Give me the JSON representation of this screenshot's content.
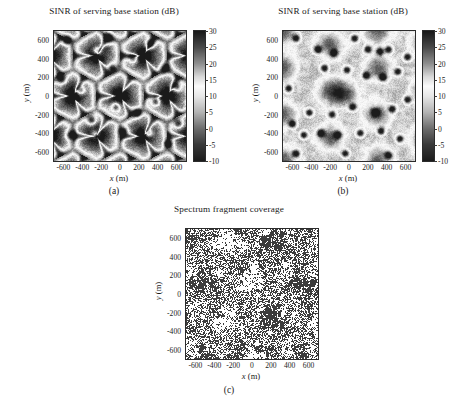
{
  "figure": {
    "width": 457,
    "height": 402,
    "background": "#ffffff",
    "font_color": "#1a1a1a"
  },
  "panels": [
    {
      "id": "panel-a",
      "caption": "(a)",
      "title": "SINR of serving base station (dB)",
      "xlabel_var": "x",
      "xlabel_unit": "(m)",
      "ylabel_var": "y",
      "ylabel_unit": "(m)"
    },
    {
      "id": "panel-b",
      "caption": "(b)",
      "title": "SINR of serving base station (dB)",
      "xlabel_var": "x",
      "xlabel_unit": "(m)",
      "ylabel_var": "y",
      "ylabel_unit": "(m)"
    },
    {
      "id": "panel-c",
      "caption": "(c)",
      "title": "Spectrum fragment coverage",
      "xlabel_var": "x",
      "xlabel_unit": "(m)",
      "ylabel_var": "y",
      "ylabel_unit": "(m)"
    }
  ],
  "chart_data": [
    {
      "id": "panel-a",
      "type": "heatmap",
      "title": "SINR of serving base station (dB)",
      "xlabel": "x (m)",
      "ylabel": "y (m)",
      "xlim": [
        -700,
        700
      ],
      "ylim": [
        -700,
        700
      ],
      "xticks": [
        -600,
        -400,
        -200,
        0,
        200,
        400,
        600
      ],
      "yticks": [
        -600,
        -400,
        -200,
        0,
        200,
        400,
        600
      ],
      "xticklabels": [
        "-600",
        "-400",
        "-200",
        "0",
        "200",
        "400",
        "600"
      ],
      "yticklabels": [
        "-600",
        "-400",
        "-200",
        "0",
        "200",
        "400",
        "600"
      ],
      "grid": false,
      "colorbar": {
        "label": "",
        "vmin": -10,
        "vmax": 30,
        "ticks": [
          -10,
          -5,
          0,
          5,
          10,
          15,
          20,
          25,
          30
        ],
        "ticklabels": [
          "-10",
          "-5",
          "0",
          "5",
          "10",
          "15",
          "20",
          "25",
          "30"
        ],
        "orientation": "vertical",
        "position": "right",
        "colormap": "gray-inverted-diverging",
        "colormap_stops": [
          {
            "value": -10,
            "color": "#1c1c1c"
          },
          {
            "value": -5,
            "color": "#3a3a3a"
          },
          {
            "value": 0,
            "color": "#6e6e6e"
          },
          {
            "value": 5,
            "color": "#b4b4b4"
          },
          {
            "value": 10,
            "color": "#e8e8e8"
          },
          {
            "value": 13,
            "color": "#fbfbfb"
          },
          {
            "value": 16,
            "color": "#d8d8d8"
          },
          {
            "value": 20,
            "color": "#8f8f8f"
          },
          {
            "value": 25,
            "color": "#4a4a4a"
          },
          {
            "value": 30,
            "color": "#1a1a1a"
          }
        ]
      },
      "scene": {
        "description": "Sectorized (3-sector) macro deployment: bright cell-centre plateaus with dark triangular cell-edge wedges converging at hexagonal site vertices, plus scattered dark small-cell spots.",
        "site_spacing_m": 500,
        "sector_count": 3,
        "site_positions": [
          [
            -700,
            -700
          ],
          [
            -700,
            -200
          ],
          [
            -700,
            300
          ],
          [
            -200,
            -450
          ],
          [
            -200,
            50
          ],
          [
            -200,
            550
          ],
          [
            300,
            -700
          ],
          [
            300,
            -200
          ],
          [
            300,
            300
          ],
          [
            -700,
            700
          ],
          [
            300,
            700
          ],
          [
            800,
            -450
          ],
          [
            800,
            50
          ],
          [
            800,
            550
          ]
        ],
        "hotspot_positions": [
          [
            -560,
            600
          ],
          [
            -240,
            480
          ],
          [
            -80,
            300
          ],
          [
            140,
            400
          ],
          [
            320,
            560
          ],
          [
            480,
            300
          ],
          [
            600,
            100
          ],
          [
            380,
            -60
          ],
          [
            180,
            -180
          ],
          [
            -40,
            -120
          ],
          [
            -300,
            -260
          ],
          [
            -520,
            -420
          ],
          [
            -260,
            -420
          ],
          [
            40,
            -380
          ],
          [
            300,
            -400
          ],
          [
            520,
            -520
          ],
          [
            620,
            -300
          ],
          [
            -620,
            180
          ],
          [
            -420,
            60
          ],
          [
            -120,
            620
          ]
        ],
        "noise_amplitude_db": 3.2,
        "value_range_db": [
          -10,
          30
        ]
      }
    },
    {
      "id": "panel-b",
      "type": "heatmap",
      "title": "SINR of serving base station (dB)",
      "xlabel": "x (m)",
      "ylabel": "y (m)",
      "xlim": [
        -700,
        700
      ],
      "ylim": [
        -700,
        700
      ],
      "xticks": [
        -600,
        -400,
        -200,
        0,
        200,
        400,
        600
      ],
      "yticks": [
        -600,
        -400,
        -200,
        0,
        200,
        400,
        600
      ],
      "xticklabels": [
        "-600",
        "-400",
        "-200",
        "0",
        "200",
        "400",
        "600"
      ],
      "yticklabels": [
        "-600",
        "-400",
        "-200",
        "0",
        "200",
        "400",
        "600"
      ],
      "grid": false,
      "colorbar": {
        "label": "",
        "vmin": -10,
        "vmax": 30,
        "ticks": [
          -10,
          -5,
          0,
          5,
          10,
          15,
          20,
          25,
          30
        ],
        "ticklabels": [
          "-10",
          "-5",
          "0",
          "5",
          "10",
          "15",
          "20",
          "25",
          "30"
        ],
        "orientation": "vertical",
        "position": "right",
        "colormap": "gray-inverted-diverging",
        "colormap_stops": [
          {
            "value": -10,
            "color": "#1c1c1c"
          },
          {
            "value": -5,
            "color": "#3a3a3a"
          },
          {
            "value": 0,
            "color": "#6e6e6e"
          },
          {
            "value": 5,
            "color": "#b4b4b4"
          },
          {
            "value": 10,
            "color": "#e8e8e8"
          },
          {
            "value": 13,
            "color": "#fbfbfb"
          },
          {
            "value": 16,
            "color": "#d8d8d8"
          },
          {
            "value": 20,
            "color": "#8f8f8f"
          },
          {
            "value": 25,
            "color": "#4a4a4a"
          },
          {
            "value": 30,
            "color": "#1a1a1a"
          }
        ]
      },
      "scene": {
        "description": "Omnidirectional deployment: mostly bright high-SINR background with diffuse dark blobs centred on macro sites and many small circular dark spots at small-cell locations.",
        "site_spacing_m": 500,
        "sector_count": 1,
        "blob_positions": [
          [
            -700,
            -700
          ],
          [
            -700,
            -200
          ],
          [
            -700,
            300
          ],
          [
            -700,
            700
          ],
          [
            -200,
            -450
          ],
          [
            -200,
            50
          ],
          [
            -200,
            550
          ],
          [
            300,
            -700
          ],
          [
            300,
            -200
          ],
          [
            300,
            300
          ],
          [
            300,
            700
          ],
          [
            800,
            -450
          ],
          [
            800,
            50
          ],
          [
            800,
            550
          ],
          [
            -40,
            20
          ]
        ],
        "hotspot_positions": [
          [
            -560,
            620
          ],
          [
            -330,
            500
          ],
          [
            -160,
            460
          ],
          [
            60,
            620
          ],
          [
            200,
            500
          ],
          [
            330,
            480
          ],
          [
            420,
            500
          ],
          [
            -260,
            300
          ],
          [
            -20,
            280
          ],
          [
            180,
            220
          ],
          [
            360,
            200
          ],
          [
            520,
            260
          ],
          [
            620,
            -40
          ],
          [
            460,
            -140
          ],
          [
            280,
            -180
          ],
          [
            40,
            -120
          ],
          [
            -180,
            -200
          ],
          [
            -420,
            -180
          ],
          [
            -600,
            -300
          ],
          [
            -480,
            -420
          ],
          [
            -300,
            -400
          ],
          [
            -120,
            -420
          ],
          [
            120,
            -400
          ],
          [
            340,
            -380
          ],
          [
            540,
            -460
          ],
          [
            -560,
            -620
          ],
          [
            -40,
            -620
          ],
          [
            420,
            -640
          ],
          [
            620,
            420
          ],
          [
            -640,
            80
          ]
        ],
        "noise_amplitude_db": 2.6,
        "value_range_db": [
          -10,
          30
        ]
      }
    },
    {
      "id": "panel-c",
      "type": "heatmap",
      "title": "Spectrum fragment coverage",
      "xlabel": "x (m)",
      "ylabel": "y (m)",
      "xlim": [
        -700,
        700
      ],
      "ylim": [
        -700,
        700
      ],
      "xticks": [
        -600,
        -400,
        -200,
        0,
        200,
        400,
        600
      ],
      "yticks": [
        -600,
        -400,
        -200,
        0,
        200,
        400,
        600
      ],
      "xticklabels": [
        "-600",
        "-400",
        "-200",
        "0",
        "200",
        "400",
        "600"
      ],
      "yticklabels": [
        "-600",
        "-400",
        "-200",
        "0",
        "200",
        "400",
        "600"
      ],
      "grid": false,
      "colorbar": null,
      "scene": {
        "description": "Binary coverage map of a single spectrum fragment: alternating up/down triangular sector tiles, covered (dark) vs uncovered (white), with noisy fractal boundaries and speckled mixed regions.",
        "binary": true,
        "levels": [
          0,
          1
        ],
        "level_colors": [
          "#ffffff",
          "#3c3c3c"
        ],
        "triangle_side_m": 500,
        "triangle_rows": 6,
        "noise_amplitude_m": 120
      }
    }
  ]
}
